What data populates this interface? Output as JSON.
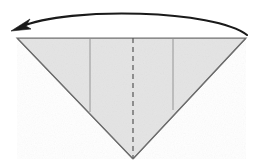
{
  "figure": {
    "description": "Inverted triangle of folded paper with a curved fold arrow sweeping from the right corner to the left corner",
    "canvas": {
      "width": 259,
      "height": 166,
      "background": "#ffffff"
    }
  },
  "shape": {
    "name": "inverted-triangle",
    "fill_color": "#e4e4e4",
    "stroke_color": "#6e6e6e",
    "stroke_width": 1.2,
    "points": {
      "top_left": {
        "x": 17,
        "y": 38
      },
      "top_right": {
        "x": 246,
        "y": 38
      },
      "bottom_apex": {
        "x": 133,
        "y": 159
      }
    },
    "polygon": "17,38 246,38 133,159"
  },
  "creases": [
    {
      "name": "left-crease-line",
      "style": "solid",
      "color": "#8c8c8c",
      "width": 0.9,
      "x1": 90,
      "y1": 38,
      "x2": 90,
      "y2": 112
    },
    {
      "name": "right-crease-line",
      "style": "solid",
      "color": "#8c8c8c",
      "width": 0.9,
      "x1": 173,
      "y1": 38,
      "x2": 173,
      "y2": 110
    },
    {
      "name": "center-fold-line",
      "style": "dashed",
      "color": "#555555",
      "width": 1.2,
      "dash": "5 4",
      "x1": 133,
      "y1": 38,
      "x2": 133,
      "y2": 158
    }
  ],
  "arrow": {
    "name": "fold-arrow",
    "direction": "right-to-left",
    "color": "#1a1a1a",
    "stroke_width": 2.1,
    "path": "M 247 35 C 215 10, 70 6, 20 27",
    "head": {
      "tip": {
        "x": 11,
        "y": 31
      },
      "polygon": "11,31 30,19 26,26 31,29"
    }
  }
}
